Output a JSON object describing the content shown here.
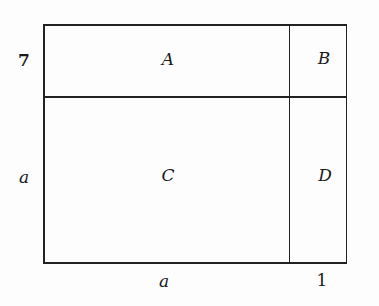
{
  "diagram": {
    "type": "area-model",
    "regions": {
      "top_left": "A",
      "top_right": "B",
      "bottom_left": "C",
      "bottom_right": "D"
    },
    "side_labels": {
      "left_top": "7",
      "left_bottom": "a",
      "bottom_left": "a",
      "bottom_right": "1"
    },
    "line_color": "#222222"
  }
}
